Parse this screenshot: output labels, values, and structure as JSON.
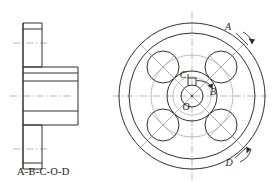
{
  "drawing": {
    "title_caption": "A-B-C-O-D",
    "views": {
      "section_view": {
        "name": "left-section-view",
        "description": "cross-section profile of flanged hub"
      },
      "front_view": {
        "name": "right-circular-view",
        "description": "circular flange face with four bolt holes and keyed bore"
      }
    },
    "labels": {
      "a": "A",
      "b": "B",
      "c": "C",
      "o": "O",
      "d": "D"
    },
    "colors": {
      "outline": "#33302e",
      "centerline": "#9b9896",
      "text": "#1d1b19",
      "background": "#ffffff"
    }
  }
}
